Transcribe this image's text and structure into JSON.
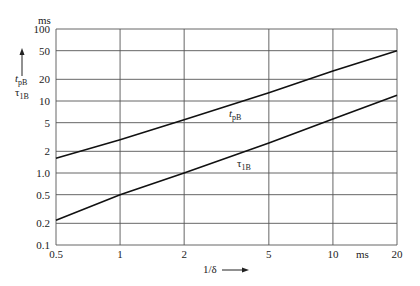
{
  "chart_data": {
    "type": "line",
    "title": "",
    "xlabel": "1/δ",
    "xunit": "ms",
    "ylabel": [
      "t_pB",
      "τ_1B"
    ],
    "yunit": "ms",
    "xscale": "log",
    "yscale": "log",
    "xlim": [
      0.5,
      20
    ],
    "ylim": [
      0.1,
      100
    ],
    "grid": true,
    "x_ticks": [
      "0.5",
      "1",
      "2",
      "5",
      "10",
      "20"
    ],
    "x_tick_values": [
      0.5,
      1,
      2,
      5,
      10,
      20
    ],
    "y_ticks": [
      "0.1",
      "0.2",
      "0.5",
      "1.0",
      "2",
      "5",
      "10",
      "20",
      "50",
      "100"
    ],
    "y_tick_values": [
      0.1,
      0.2,
      0.5,
      1,
      2,
      5,
      10,
      20,
      50,
      100
    ],
    "series": [
      {
        "name": "t_pB",
        "label_main": "t",
        "label_sub": "pB",
        "x": [
          0.5,
          1,
          2,
          5,
          10,
          20
        ],
        "values": [
          1.6,
          2.9,
          5.5,
          13,
          26,
          50
        ]
      },
      {
        "name": "τ_1B",
        "label_main": "τ",
        "label_sub": "1B",
        "x": [
          0.5,
          1,
          2,
          5,
          10,
          20
        ],
        "values": [
          0.22,
          0.5,
          1.0,
          2.6,
          5.6,
          12
        ]
      }
    ]
  },
  "labels": {
    "y_unit": "ms",
    "x_unit": "ms",
    "x_axis_label": "1/δ",
    "y_axis_label_1_main": "t",
    "y_axis_label_1_sub": "pB",
    "y_axis_label_2_main": "τ",
    "y_axis_label_2_sub": "1B"
  }
}
